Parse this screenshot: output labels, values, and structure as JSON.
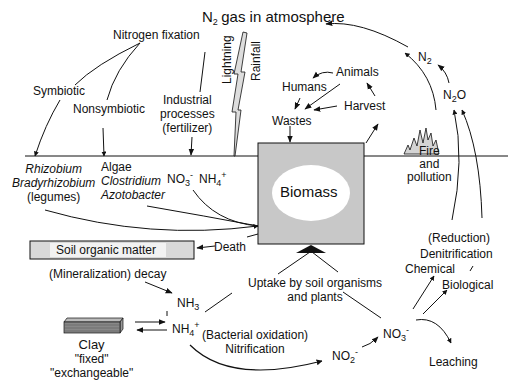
{
  "atmosphere": {
    "n2_label": "N",
    "n2_sub": "2",
    "gas_label": "gas in atmosphere"
  },
  "fixation": {
    "title": "Nitrogen fixation",
    "symbiotic": "Symbiotic",
    "nonsymbiotic": "Nonsymbiotic",
    "industrial": [
      "Industrial",
      "processes",
      "(fertilizer)"
    ],
    "lightning": "Lightning",
    "rainfall": "Rainfall"
  },
  "organisms": {
    "symbiotic": [
      "Rhizobium",
      "Bradyrhizobium",
      "(legumes)"
    ],
    "nonsymbiotic": [
      "Algae",
      "Clostridium",
      "Azotobacter"
    ]
  },
  "ions": {
    "no3": "NO",
    "no3_sub": "3",
    "no3_sup": "-",
    "nh4": "NH",
    "nh4_sub": "4",
    "nh4_sup": "+",
    "nh3": "NH",
    "nh3_sub": "3",
    "no2": "NO",
    "no2_sub": "2",
    "no2_sup": "-",
    "n2o_n": "N",
    "n2o_sub": "2",
    "n2o_o": "O"
  },
  "food_web": {
    "animals": "Animals",
    "humans": "Humans",
    "harvest": "Harvest",
    "wastes": "Wastes"
  },
  "biomass": {
    "label": "Biomass"
  },
  "fire": [
    "Fire",
    "and",
    "pollution"
  ],
  "soil": {
    "organic_matter": "Soil organic matter",
    "death": "Death",
    "mineralization": "(Mineralization) decay",
    "uptake": [
      "Uptake by soil organisms",
      "and plants"
    ]
  },
  "clay": {
    "label": "Clay",
    "fixed": "\"fixed\"",
    "exchangeable": "\"exchangeable\""
  },
  "nitrification": [
    "(Bacterial oxidation)",
    "Nitrification"
  ],
  "denitrification": {
    "reduction": "(Reduction)",
    "label": "Denitrification",
    "chemical": "Chemical",
    "biological": "Biological"
  },
  "leaching": "Leaching",
  "colors": {
    "ink": "#111111",
    "box_fill": "#c8c8c8",
    "fire_fill": "#d4d4d4",
    "ellipse_fill": "#ffffff"
  }
}
